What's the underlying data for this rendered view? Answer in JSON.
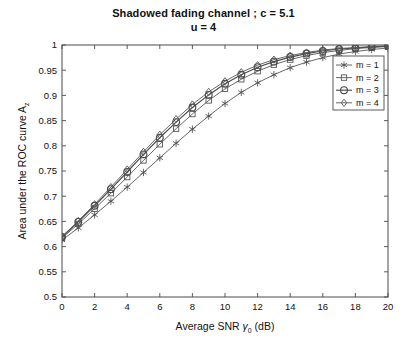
{
  "figure": {
    "title": "Shadowed fading channel ; c = 5.1",
    "subtitle": "u = 4",
    "background_color": "#ffffff",
    "axes_color": "#3d3d3d",
    "line_color": "#4d4d4d"
  },
  "axis": {
    "x_title_main": "Average SNR ",
    "x_title_symbol": "γ",
    "x_title_sub": "0",
    "x_title_unit": " (dB)",
    "y_title_main": "Area under the ROC curve A",
    "y_title_sub": "z",
    "x_ticks": [
      "0",
      "2",
      "4",
      "6",
      "8",
      "10",
      "12",
      "14",
      "16",
      "18",
      "20"
    ],
    "y_ticks": [
      "0.5",
      "0.55",
      "0.6",
      "0.65",
      "0.7",
      "0.75",
      "0.8",
      "0.85",
      "0.9",
      "0.95",
      "1"
    ]
  },
  "legend": {
    "position": "top-right-inside",
    "entries": [
      {
        "label": "m = 1",
        "marker": "asterisk-marker"
      },
      {
        "label": "m = 2",
        "marker": "square-marker"
      },
      {
        "label": "m = 3",
        "marker": "circle-marker"
      },
      {
        "label": "m = 4",
        "marker": "diamond-marker"
      }
    ]
  },
  "chart_data": {
    "type": "line",
    "title": "Shadowed fading channel ; c = 5.1",
    "subtitle": "u = 4",
    "xlabel": "Average SNR γ₀ (dB)",
    "ylabel": "Area under the ROC curve A_z",
    "xlim": [
      0,
      20
    ],
    "ylim": [
      0.5,
      1.0
    ],
    "xticks": [
      0,
      2,
      4,
      6,
      8,
      10,
      12,
      14,
      16,
      18,
      20
    ],
    "yticks": [
      0.5,
      0.55,
      0.6,
      0.65,
      0.7,
      0.75,
      0.8,
      0.85,
      0.9,
      0.95,
      1.0
    ],
    "grid": false,
    "legend_position": "upper right",
    "x": [
      0,
      1,
      2,
      3,
      4,
      5,
      6,
      7,
      8,
      9,
      10,
      11,
      12,
      13,
      14,
      15,
      16,
      17,
      18,
      19,
      20
    ],
    "series": [
      {
        "name": "m = 1",
        "marker": "asterisk",
        "values": [
          0.613,
          0.637,
          0.663,
          0.69,
          0.718,
          0.747,
          0.776,
          0.805,
          0.833,
          0.859,
          0.884,
          0.906,
          0.925,
          0.941,
          0.955,
          0.966,
          0.975,
          0.982,
          0.987,
          0.991,
          0.994
        ]
      },
      {
        "name": "m = 2",
        "marker": "square",
        "values": [
          0.617,
          0.645,
          0.675,
          0.706,
          0.738,
          0.771,
          0.803,
          0.834,
          0.863,
          0.89,
          0.913,
          0.932,
          0.948,
          0.961,
          0.971,
          0.979,
          0.985,
          0.989,
          0.993,
          0.995,
          0.997
        ]
      },
      {
        "name": "m = 3",
        "marker": "circle",
        "values": [
          0.619,
          0.649,
          0.681,
          0.714,
          0.748,
          0.783,
          0.816,
          0.847,
          0.876,
          0.901,
          0.923,
          0.941,
          0.956,
          0.967,
          0.976,
          0.983,
          0.988,
          0.992,
          0.994,
          0.996,
          0.998
        ]
      },
      {
        "name": "m = 4",
        "marker": "diamond",
        "values": [
          0.62,
          0.651,
          0.684,
          0.718,
          0.753,
          0.788,
          0.822,
          0.853,
          0.882,
          0.907,
          0.928,
          0.946,
          0.96,
          0.971,
          0.979,
          0.985,
          0.99,
          0.993,
          0.995,
          0.997,
          0.998
        ]
      }
    ]
  }
}
